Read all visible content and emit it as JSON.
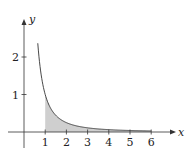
{
  "chart_data": {
    "type": "area",
    "title": "",
    "function": "y = 1/x^2",
    "xlabel": "x",
    "ylabel": "y",
    "x_ticks": [
      "1",
      "2",
      "3",
      "4",
      "5",
      "6"
    ],
    "y_ticks": [
      "1",
      "2"
    ],
    "xlim": [
      -0.6,
      6.6
    ],
    "ylim": [
      -0.3,
      2.9
    ],
    "curve_domain": [
      0.65,
      6
    ],
    "shaded_region": {
      "from": 1,
      "to": 6,
      "between": "curve and x-axis"
    },
    "points": [
      {
        "x": 0.65,
        "y": 2.37
      },
      {
        "x": 1,
        "y": 1.0
      },
      {
        "x": 1.5,
        "y": 0.44
      },
      {
        "x": 2,
        "y": 0.25
      },
      {
        "x": 3,
        "y": 0.11
      },
      {
        "x": 4,
        "y": 0.06
      },
      {
        "x": 5,
        "y": 0.04
      },
      {
        "x": 6,
        "y": 0.03
      }
    ],
    "grid": false,
    "colors": {
      "curve": "#333333",
      "fill": "#cfcfcf",
      "axes": "#333333"
    }
  }
}
